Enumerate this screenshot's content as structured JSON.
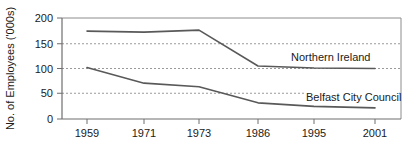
{
  "chart_data": {
    "type": "line",
    "title": "",
    "xlabel": "",
    "ylabel": "No. of Employees ('000s)",
    "x_categories": [
      "1959",
      "1971",
      "1973",
      "1986",
      "1995",
      "2001"
    ],
    "y_ticks": [
      "0",
      "50",
      "100",
      "150",
      "200"
    ],
    "ylim": [
      0,
      200
    ],
    "grid": "horizontal-dashed",
    "legend_position": "inline-right",
    "series": [
      {
        "name": "Northern Ireland",
        "label": "Northern Ireland",
        "values": [
          174,
          172,
          176,
          105,
          101,
          100
        ],
        "color": "#595959"
      },
      {
        "name": "Belfast City Council",
        "label": "Belfast City Council",
        "values": [
          102,
          71,
          64,
          32,
          25,
          22
        ],
        "color": "#595959"
      }
    ]
  },
  "axes": {
    "y_axis_title": "No. of Employees ('000s)",
    "y_tick_0": "0",
    "y_tick_50": "50",
    "y_tick_100": "100",
    "y_tick_150": "150",
    "y_tick_200": "200",
    "x_tick_1": "1959",
    "x_tick_2": "1971",
    "x_tick_3": "1973",
    "x_tick_4": "1986",
    "x_tick_5": "1995",
    "x_tick_6": "2001"
  },
  "annotations": {
    "northern_ireland_label": "Northern Ireland",
    "belfast_city_council_label": "Belfast City Council"
  },
  "colors": {
    "line": "#595959",
    "axis": "#808080",
    "grid": "#9a9a9a",
    "text": "#1a1a1a",
    "background": "#ffffff"
  }
}
